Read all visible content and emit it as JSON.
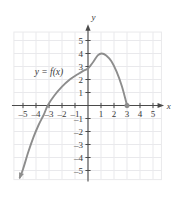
{
  "chart_data": {
    "type": "line",
    "title": "",
    "xlabel": "x",
    "ylabel": "y",
    "grid": true,
    "legend_position": "inside-left",
    "xlim": [
      -5.8,
      5.8
    ],
    "ylim": [
      -5.8,
      5.8
    ],
    "x_ticks": [
      -5,
      -4,
      -3,
      -2,
      -1,
      1,
      2,
      3,
      4,
      5
    ],
    "y_ticks": [
      -5,
      -4,
      -3,
      -2,
      -1,
      1,
      2,
      3,
      4,
      5
    ],
    "x_tick_labels": [
      "–5",
      "–4",
      "–3",
      "–2",
      "–1",
      "1",
      "2",
      "3",
      "4",
      "5"
    ],
    "y_tick_labels": [
      "–5",
      "–4",
      "–3",
      "–2",
      "–1",
      "1",
      "2",
      "3",
      "4",
      "5"
    ],
    "series": [
      {
        "name": "y = f(x)",
        "color": "#8d8d8d",
        "start_arrow": true,
        "end_point_filled": true,
        "points": [
          [
            -5.25,
            -5.55
          ],
          [
            -5.0,
            -4.9
          ],
          [
            -4.6,
            -3.6
          ],
          [
            -4.2,
            -2.45
          ],
          [
            -3.8,
            -1.5
          ],
          [
            -3.4,
            -0.7
          ],
          [
            -3.1,
            0.0
          ],
          [
            -2.6,
            0.75
          ],
          [
            -2.0,
            1.45
          ],
          [
            -1.4,
            2.0
          ],
          [
            -0.8,
            2.4
          ],
          [
            -0.4,
            2.65
          ],
          [
            0.0,
            2.85
          ],
          [
            0.4,
            3.35
          ],
          [
            0.75,
            3.85
          ],
          [
            1.05,
            4.0
          ],
          [
            1.4,
            3.85
          ],
          [
            1.8,
            3.4
          ],
          [
            2.2,
            2.6
          ],
          [
            2.6,
            1.5
          ],
          [
            2.9,
            0.4
          ],
          [
            3.0,
            0.0
          ]
        ]
      }
    ],
    "annotations": [
      {
        "text": "y = f(x)",
        "x": -4.1,
        "y": 2.35
      }
    ],
    "markers": [
      {
        "x": 3,
        "y": 0,
        "style": "filled-circle"
      }
    ]
  },
  "axes": {
    "x_axis_label": "x",
    "y_axis_label": "y"
  },
  "colors": {
    "curve": "#8d8d8d",
    "axis": "#4a4a4a",
    "grid": "#e9e9ec",
    "text": "#3a3a3a",
    "background": "#ffffff"
  }
}
